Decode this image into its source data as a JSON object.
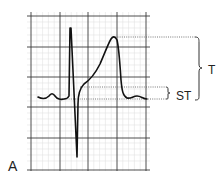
{
  "figure": {
    "panel_label": "A",
    "type": "ECG waveform on grid paper",
    "annotations": {
      "t_label": "T",
      "st_label": "ST"
    }
  },
  "colors": {
    "trace": "#111111",
    "major_grid": "#3a3a3a",
    "minor_grid": "#dcdcdc",
    "dotted": "#555555",
    "background": "#ffffff"
  }
}
